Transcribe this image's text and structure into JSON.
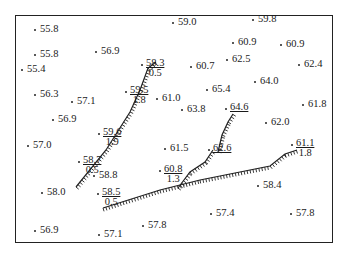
{
  "map": {
    "type": "spot-height map with hachured lines",
    "spot_heights": [
      {
        "id": "p1",
        "value": "55.8",
        "x": 34,
        "y": 28
      },
      {
        "id": "p2",
        "value": "59.0",
        "x": 172,
        "y": 21
      },
      {
        "id": "p3",
        "value": "59.8",
        "x": 252,
        "y": 18
      },
      {
        "id": "p4",
        "value": "55.8",
        "x": 34,
        "y": 53
      },
      {
        "id": "p5",
        "value": "56.9",
        "x": 95,
        "y": 50
      },
      {
        "id": "p6",
        "value": "60.9",
        "x": 232,
        "y": 41
      },
      {
        "id": "p7",
        "value": "60.9",
        "x": 280,
        "y": 43
      },
      {
        "id": "p8",
        "value": "55.4",
        "x": 21,
        "y": 68
      },
      {
        "id": "p9",
        "value": "60.7",
        "x": 190,
        "y": 65
      },
      {
        "id": "p10",
        "value": "62.5",
        "x": 226,
        "y": 58
      },
      {
        "id": "p11",
        "value": "62.4",
        "x": 298,
        "y": 63
      },
      {
        "id": "p12",
        "value": "56.3",
        "x": 34,
        "y": 93
      },
      {
        "id": "p13",
        "value": "57.1",
        "x": 71,
        "y": 100
      },
      {
        "id": "p14",
        "value": "61.0",
        "x": 156,
        "y": 97
      },
      {
        "id": "p15",
        "value": "65.4",
        "x": 206,
        "y": 88
      },
      {
        "id": "p16",
        "value": "64.0",
        "x": 254,
        "y": 80
      },
      {
        "id": "p17",
        "value": "56.9",
        "x": 52,
        "y": 118
      },
      {
        "id": "p18",
        "value": "63.8",
        "x": 181,
        "y": 108
      },
      {
        "id": "p19",
        "value": "61.8",
        "x": 302,
        "y": 103
      },
      {
        "id": "p20",
        "value": "62.0",
        "x": 265,
        "y": 121
      },
      {
        "id": "p21",
        "value": "57.0",
        "x": 27,
        "y": 144
      },
      {
        "id": "p22",
        "value": "61.5",
        "x": 164,
        "y": 147
      },
      {
        "id": "p23",
        "value": "58.8",
        "x": 93,
        "y": 174
      },
      {
        "id": "p24",
        "value": "58.0",
        "x": 41,
        "y": 191
      },
      {
        "id": "p25",
        "value": "58.4",
        "x": 257,
        "y": 184
      },
      {
        "id": "p26",
        "value": "57.4",
        "x": 210,
        "y": 212
      },
      {
        "id": "p27",
        "value": "57.8",
        "x": 290,
        "y": 212
      },
      {
        "id": "p28",
        "value": "57.8",
        "x": 142,
        "y": 224
      },
      {
        "id": "p29",
        "value": "56.9",
        "x": 34,
        "y": 229
      },
      {
        "id": "p30",
        "value": "57.1",
        "x": 98,
        "y": 233
      }
    ],
    "fraction_labels": [
      {
        "id": "f1",
        "num": "58.3",
        "den": "0.5",
        "x": 146,
        "y": 58
      },
      {
        "id": "f2",
        "num": "59.5",
        "den": "1.8",
        "x": 130,
        "y": 85
      },
      {
        "id": "f3",
        "num": "59.6",
        "den": "1.9",
        "x": 103,
        "y": 127
      },
      {
        "id": "f4",
        "num": "58.7",
        "den": "0.5",
        "x": 83,
        "y": 155
      },
      {
        "id": "f5",
        "num": "58.5",
        "den": "0.5",
        "x": 102,
        "y": 187
      },
      {
        "id": "f6",
        "num": "60.8",
        "den": "1.3",
        "x": 164,
        "y": 164
      },
      {
        "id": "f7",
        "num": "62.6",
        "den": "",
        "x": 213,
        "y": 143
      },
      {
        "id": "f8",
        "num": "64.6",
        "den": "",
        "x": 230,
        "y": 102
      },
      {
        "id": "f9",
        "num": "61.1",
        "den": "1.8",
        "x": 296,
        "y": 138
      }
    ],
    "hachured_lines": [
      {
        "id": "scarp-west",
        "points": "76,187 106,150 130,112 140,90 148,68 156,62"
      },
      {
        "id": "scarp-south",
        "points": "103,208 160,190 200,180 270,166 285,154 297,150"
      },
      {
        "id": "scarp-branch",
        "points": "178,188 190,172 205,162 213,150"
      },
      {
        "id": "scarp-north",
        "points": "218,152 222,135 228,122 233,114"
      }
    ],
    "colors": {
      "ink": "#1a1a1a",
      "background": "#ffffff",
      "frame": "#222222"
    }
  }
}
